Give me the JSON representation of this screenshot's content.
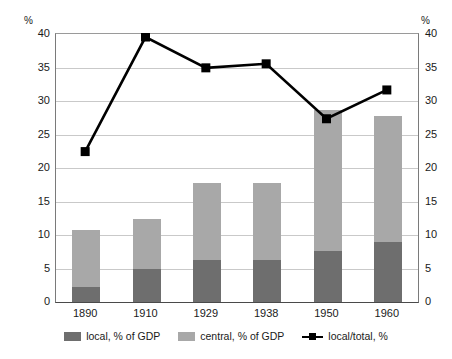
{
  "chart_data": {
    "type": "bar",
    "title": "",
    "subtitle": "",
    "xlabel": "",
    "ylabel": "%",
    "y2label": "%",
    "categories": [
      "1890",
      "1910",
      "1929",
      "1938",
      "1950",
      "1960"
    ],
    "ylim": [
      0,
      40
    ],
    "y2lim": [
      0,
      40
    ],
    "ytick_labels": [
      "0",
      "5",
      "10",
      "15",
      "20",
      "25",
      "30",
      "35",
      "40"
    ],
    "ytick_values": [
      0,
      5,
      10,
      15,
      20,
      25,
      30,
      35,
      40
    ],
    "y2tick_labels": [
      "0",
      "5",
      "10",
      "15",
      "20",
      "25",
      "30",
      "35",
      "40"
    ],
    "y2tick_values": [
      0,
      5,
      10,
      15,
      20,
      25,
      30,
      35,
      40
    ],
    "grid": true,
    "stacked": true,
    "legend_position": "bottom",
    "series": [
      {
        "name": "local, % of GDP",
        "kind": "bar-segment",
        "color": "#6e6e6e",
        "axis": "left",
        "values": [
          2.3,
          4.9,
          6.2,
          6.3,
          7.6,
          8.9
        ]
      },
      {
        "name": "central, % of GDP",
        "kind": "bar-segment",
        "color": "#a8a8a8",
        "axis": "left",
        "values": [
          8.4,
          7.5,
          11.6,
          11.4,
          21.1,
          18.8
        ]
      },
      {
        "name": "local/total, %",
        "kind": "line",
        "color": "#000000",
        "axis": "right",
        "marker": "square",
        "values": [
          22.3,
          39.4,
          34.8,
          35.4,
          27.2,
          31.5
        ]
      }
    ],
    "stack_totals": [
      10.7,
      12.4,
      17.8,
      17.7,
      28.7,
      27.7
    ]
  },
  "legend": {
    "items": [
      {
        "label": "local, % of GDP",
        "color": "#6e6e6e",
        "type": "swatch"
      },
      {
        "label": "central, % of GDP",
        "color": "#a8a8a8",
        "type": "swatch"
      },
      {
        "label": "local/total, %",
        "color": "#000000",
        "type": "line-marker"
      }
    ]
  },
  "axes": {
    "left_unit": "%",
    "right_unit": "%"
  }
}
